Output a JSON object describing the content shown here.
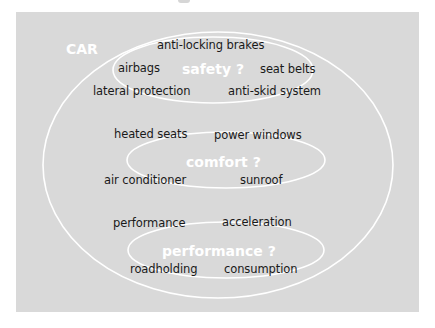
{
  "diagram": {
    "root": "CAR",
    "groups": [
      {
        "category": "safety ?",
        "features": [
          "anti-locking brakes",
          "airbags",
          "seat belts",
          "lateral protection",
          "anti-skid system"
        ]
      },
      {
        "category": "comfort ?",
        "features": [
          "heated seats",
          "power windows",
          "air conditioner",
          "sunroof"
        ]
      },
      {
        "category": "performance ?",
        "features": [
          "performance",
          "acceleration",
          "roadholding",
          "consumption"
        ]
      }
    ]
  },
  "colors": {
    "panel": "#d9d9d9",
    "rings": "#ffffff",
    "text": "#1a1a1a",
    "category_text": "#ffffff"
  }
}
